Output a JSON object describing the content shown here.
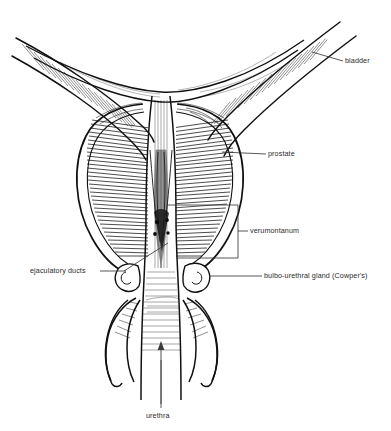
{
  "figure": {
    "background_color": "#ffffff",
    "ink_color": "#111111",
    "label_color": "#2b2b2b"
  },
  "labels": {
    "bladder": "bladder",
    "prostate": "prostate",
    "verumontanum": "verumontanum",
    "bulbo_urethral": "bulbo-urethral gland (Cowper's)",
    "ejaculatory_ducts": "ejaculatory ducts",
    "urethra": "urethra"
  },
  "structures": [
    "bladder",
    "prostate",
    "verumontanum",
    "bulbo-urethral gland (Cowper's)",
    "ejaculatory ducts",
    "urethra"
  ]
}
